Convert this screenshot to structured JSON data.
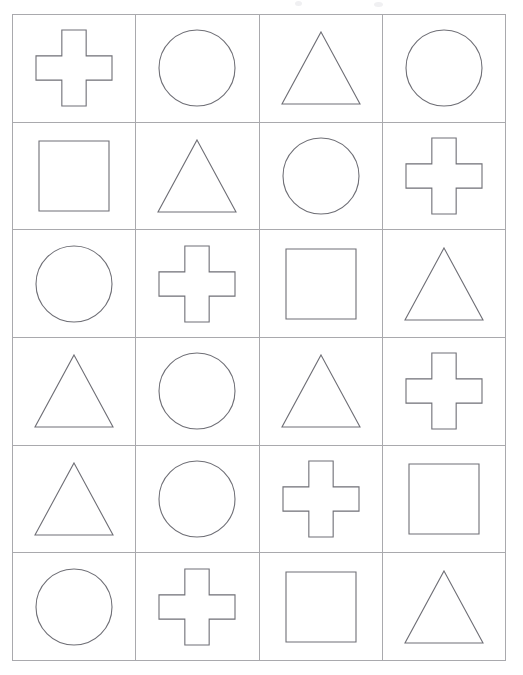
{
  "page": {
    "background_color": "#ffffff",
    "width": 523,
    "height": 675
  },
  "grid": {
    "columns": 4,
    "rows": 6,
    "line_color": "#a9a9ad",
    "shape_stroke_color": "#6f6f76",
    "shape_fill": "none",
    "x": 12,
    "y": 14,
    "width": 494,
    "height": 647,
    "cells": [
      {
        "row": 1,
        "col": 1,
        "shape": "cross",
        "label": "cross"
      },
      {
        "row": 1,
        "col": 2,
        "shape": "circle",
        "label": "circle"
      },
      {
        "row": 1,
        "col": 3,
        "shape": "triangle",
        "label": "triangle"
      },
      {
        "row": 1,
        "col": 4,
        "shape": "circle",
        "label": "circle"
      },
      {
        "row": 2,
        "col": 1,
        "shape": "square",
        "label": "square"
      },
      {
        "row": 2,
        "col": 2,
        "shape": "triangle",
        "label": "triangle"
      },
      {
        "row": 2,
        "col": 3,
        "shape": "circle",
        "label": "circle"
      },
      {
        "row": 2,
        "col": 4,
        "shape": "cross",
        "label": "cross"
      },
      {
        "row": 3,
        "col": 1,
        "shape": "circle",
        "label": "circle"
      },
      {
        "row": 3,
        "col": 2,
        "shape": "cross",
        "label": "cross"
      },
      {
        "row": 3,
        "col": 3,
        "shape": "square",
        "label": "square"
      },
      {
        "row": 3,
        "col": 4,
        "shape": "triangle",
        "label": "triangle"
      },
      {
        "row": 4,
        "col": 1,
        "shape": "triangle",
        "label": "triangle"
      },
      {
        "row": 4,
        "col": 2,
        "shape": "circle",
        "label": "circle"
      },
      {
        "row": 4,
        "col": 3,
        "shape": "triangle",
        "label": "triangle"
      },
      {
        "row": 4,
        "col": 4,
        "shape": "cross",
        "label": "cross"
      },
      {
        "row": 5,
        "col": 1,
        "shape": "triangle",
        "label": "triangle"
      },
      {
        "row": 5,
        "col": 2,
        "shape": "circle",
        "label": "circle"
      },
      {
        "row": 5,
        "col": 3,
        "shape": "cross",
        "label": "cross"
      },
      {
        "row": 5,
        "col": 4,
        "shape": "square",
        "label": "square"
      },
      {
        "row": 6,
        "col": 1,
        "shape": "circle",
        "label": "circle"
      },
      {
        "row": 6,
        "col": 2,
        "shape": "cross",
        "label": "cross"
      },
      {
        "row": 6,
        "col": 3,
        "shape": "square",
        "label": "square"
      },
      {
        "row": 6,
        "col": 4,
        "shape": "triangle",
        "label": "triangle"
      }
    ]
  },
  "shape_geometry": {
    "circle": {
      "size": 76,
      "note": "circle outline"
    },
    "square": {
      "size": 70,
      "note": "square outline"
    },
    "triangle": {
      "width": 78,
      "height": 72,
      "note": "isosceles triangle outline"
    },
    "cross": {
      "size": 76,
      "arm_fraction": 0.34,
      "note": "plus / greek cross outline"
    }
  }
}
